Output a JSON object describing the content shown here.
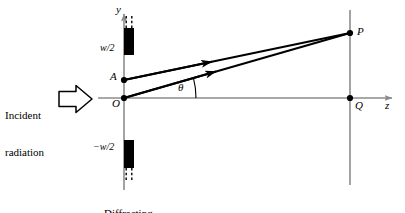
{
  "figure": {
    "background_color": "#ffffff",
    "axis_color": "#8c8c8c",
    "ink_color": "#000000",
    "aperture_fill": "#000000"
  },
  "axes": {
    "y_axis_label": "y",
    "z_axis_label": "z",
    "origin_label": "O",
    "y_axis_x": 124,
    "z_axis_y": 98,
    "screen_line_x": 350
  },
  "points": [
    {
      "name": "A",
      "label": "A",
      "x": 124,
      "y": 80
    },
    {
      "name": "O",
      "label": "O",
      "x": 124,
      "y": 98
    },
    {
      "name": "P",
      "label": "P",
      "x": 350,
      "y": 33
    },
    {
      "name": "Q",
      "label": "Q",
      "x": 350,
      "y": 98
    }
  ],
  "angle": {
    "label": "θ",
    "vertex": "O",
    "from_axis": "z",
    "to_ray": "OP"
  },
  "rays": [
    {
      "name": "ray-O-to-P",
      "from": "O",
      "to": "P",
      "arrow_mid": true
    },
    {
      "name": "ray-A-to-P",
      "from": "A",
      "to": "P",
      "arrow_mid": true
    }
  ],
  "aperture": {
    "caption_line1": "Diffracting",
    "caption_line2": "aperture",
    "upper_edge_label": "w/2",
    "lower_edge_label": "−w/2",
    "upper_block": {
      "x": 124,
      "y_top": 28,
      "y_bottom": 55,
      "width": 10
    },
    "lower_block": {
      "x": 124,
      "y_top": 140,
      "y_bottom": 168,
      "width": 10
    }
  },
  "incident": {
    "line1": "Incident",
    "line2": "radiation",
    "arrow_icon": "block-arrow-right-icon",
    "arrow_direction": "right"
  }
}
